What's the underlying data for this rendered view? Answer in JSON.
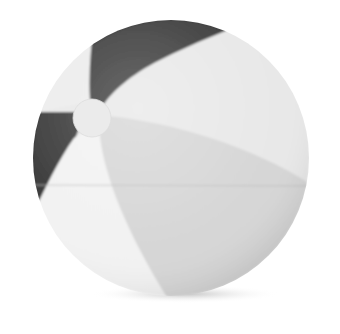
{
  "image": {
    "subject": "beach ball",
    "alt": "Grayscale product photo of an inflatable beach ball with alternating dark and light panels",
    "background": "#ffffff"
  },
  "ball": {
    "center": [
      171,
      158
    ],
    "radius": 138,
    "panel_colors": {
      "dark": "#3a3a3a",
      "light": "#e6e6e6",
      "mid": "#d4d4d4",
      "bright": "#f0f0f0"
    },
    "cap": {
      "center": [
        92,
        118
      ],
      "radius": 19,
      "color": "#ebebeb"
    },
    "seam_y": 185,
    "seam_color": "#bdbdbd",
    "shadow_color": "#cfcfcf"
  }
}
